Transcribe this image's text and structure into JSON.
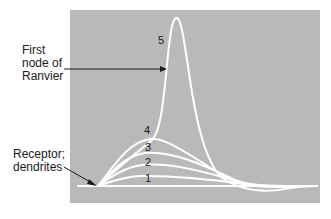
{
  "diagram": {
    "labels": {
      "ranvier_line1": "First",
      "ranvier_line2": "node of",
      "ranvier_line3": "Ranvier",
      "receptor_line1": "Receptor;",
      "receptor_line2": "dendrites"
    },
    "curve_numbers": [
      "1",
      "2",
      "3",
      "4",
      "5"
    ],
    "colors": {
      "panel": "#b9b9b9",
      "curve": "#ffffff",
      "text": "#1a1a1a",
      "arrow": "#1a1a1a"
    }
  }
}
